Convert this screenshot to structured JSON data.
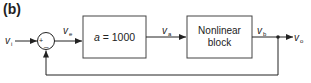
{
  "panel_label": "(b)",
  "signals": {
    "input": {
      "main": "v",
      "sub": "i"
    },
    "error": {
      "main": "v",
      "sub": "e"
    },
    "amp_out": {
      "main": "v",
      "sub": "a"
    },
    "block_out": {
      "main": "v",
      "sub": "b"
    },
    "output": {
      "main": "v",
      "sub": "o"
    }
  },
  "summing_junction": {
    "plus": "+",
    "minus": "–"
  },
  "blocks": [
    {
      "name": "amplifier",
      "text_italic": "a",
      "text_rest": " = 1000"
    },
    {
      "name": "nonlinear",
      "line1": "Nonlinear",
      "line2": "block"
    }
  ],
  "colors": {
    "stroke": "#222222",
    "box_stroke": "#444444"
  }
}
